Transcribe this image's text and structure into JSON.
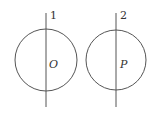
{
  "diagram": {
    "type": "geometry",
    "stroke_color": "#555555",
    "figures": [
      {
        "id": "left",
        "circle": {
          "cx": 46,
          "cy": 60,
          "r": 31
        },
        "line": {
          "x": 46,
          "y1": 13,
          "y2": 107
        },
        "line_label": "1",
        "center_label": "O"
      },
      {
        "id": "right",
        "circle": {
          "cx": 116,
          "cy": 60,
          "r": 30
        },
        "line": {
          "x": 116,
          "y1": 13,
          "y2": 107
        },
        "line_label": "2",
        "center_label": "P"
      }
    ]
  }
}
